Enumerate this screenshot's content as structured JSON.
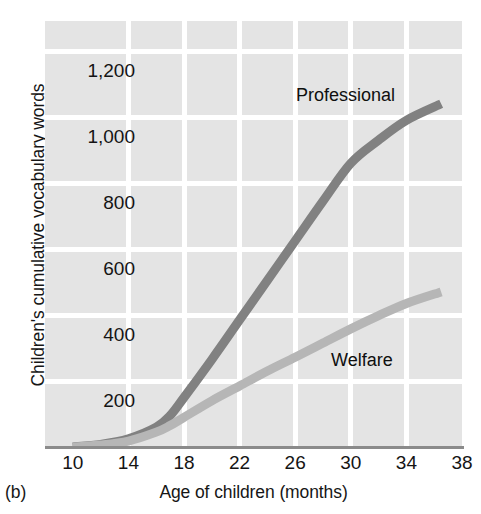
{
  "figure": {
    "panel_label": "(b)",
    "y_axis_title": "Children's cumulative vocabulary words",
    "x_axis_title": "Age of children (months)"
  },
  "chart_data": {
    "type": "line",
    "title": "",
    "subtitle": "",
    "xlabel": "Age of children (months)",
    "ylabel": "Children's cumulative vocabulary words",
    "xlim": [
      8,
      38
    ],
    "ylim": [
      0,
      1300
    ],
    "x_ticks": [
      10,
      14,
      18,
      22,
      26,
      30,
      34,
      38
    ],
    "x_tick_labels": [
      "10",
      "14",
      "18",
      "22",
      "26",
      "30",
      "34",
      "38"
    ],
    "y_ticks": [
      200,
      400,
      600,
      800,
      1000,
      1200
    ],
    "y_tick_labels": [
      "200",
      "400",
      "600",
      "800",
      "1,000",
      "1,200"
    ],
    "grid": true,
    "grid_color": "#ffffff",
    "plot_background": "#e4e4e4",
    "legend": "inline-annotations",
    "series": [
      {
        "name": "Professional",
        "color": "#818181",
        "label_position": "above-line",
        "x": [
          10,
          12,
          14,
          16,
          17,
          18,
          20,
          22,
          24,
          26,
          28,
          30,
          32,
          34,
          36.5
        ],
        "values": [
          0,
          8,
          25,
          60,
          95,
          150,
          265,
          385,
          505,
          625,
          745,
          860,
          930,
          990,
          1040
        ]
      },
      {
        "name": "Welfare",
        "color": "#b6b6b6",
        "label_position": "below-line",
        "x": [
          10,
          12,
          14,
          16,
          17,
          18,
          20,
          22,
          24,
          26,
          28,
          30,
          32,
          34,
          36.5
        ],
        "values": [
          0,
          6,
          18,
          45,
          65,
          90,
          140,
          185,
          230,
          272,
          315,
          358,
          398,
          435,
          470
        ]
      }
    ]
  }
}
